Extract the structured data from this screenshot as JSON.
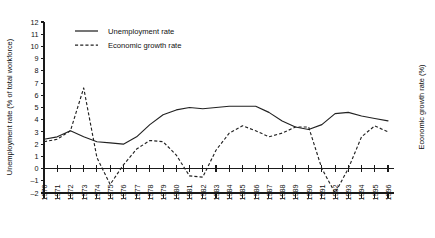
{
  "chart_data": {
    "type": "line",
    "title": "",
    "xlabel": "",
    "ylabel": "Unemployment rate (% of total workforce)",
    "y2label": "Economic growth rate (%)",
    "ylim": [
      -2,
      12
    ],
    "yticks": [
      -2,
      -1,
      0,
      1,
      2,
      3,
      4,
      5,
      6,
      7,
      8,
      9,
      10,
      11,
      12
    ],
    "ytick_labels": [
      "–2",
      "–1",
      "0",
      "1",
      "2",
      "3",
      "4",
      "5",
      "6",
      "7",
      "8",
      "9",
      "10",
      "11",
      "12"
    ],
    "grid": false,
    "legend_position": "top-left",
    "x": [
      1970,
      1971,
      1972,
      1973,
      1974,
      1975,
      1976,
      1977,
      1978,
      1979,
      1980,
      1981,
      1982,
      1983,
      1984,
      1985,
      1986,
      1987,
      1988,
      1989,
      1990,
      1991,
      1992,
      1993,
      1994,
      1995,
      1996
    ],
    "categories": [
      "1970",
      "1971",
      "1972",
      "1973",
      "1974",
      "1975",
      "1976",
      "1977",
      "1978",
      "1979",
      "1980",
      "1981",
      "1982",
      "1983",
      "1984",
      "1985",
      "1986",
      "1987",
      "1988",
      "1989",
      "1990",
      "1991",
      "1992",
      "1993",
      "1994",
      "1995",
      "1996"
    ],
    "series": [
      {
        "name": "Unemployment rate",
        "style": "solid",
        "values": [
          2.4,
          2.6,
          3.1,
          2.6,
          2.2,
          2.1,
          2.0,
          2.6,
          3.6,
          4.4,
          4.8,
          5.0,
          4.9,
          5.0,
          5.1,
          5.1,
          5.1,
          4.6,
          3.9,
          3.4,
          3.2,
          3.6,
          4.5,
          4.6,
          4.3,
          4.1,
          3.9
        ]
      },
      {
        "name": "Economic growth rate",
        "style": "dashed",
        "values": [
          2.2,
          2.4,
          3.1,
          6.6,
          0.9,
          -1.3,
          0.3,
          1.6,
          2.3,
          2.2,
          1.1,
          -0.6,
          -0.7,
          1.5,
          2.9,
          3.5,
          3.1,
          2.6,
          2.9,
          3.4,
          3.4,
          0.0,
          -2.0,
          0.0,
          2.6,
          3.5,
          3.0
        ]
      }
    ]
  },
  "legend": {
    "items": [
      {
        "label": "Unemployment rate",
        "style": "solid"
      },
      {
        "label": "Economic growth rate",
        "style": "dashed"
      }
    ]
  }
}
